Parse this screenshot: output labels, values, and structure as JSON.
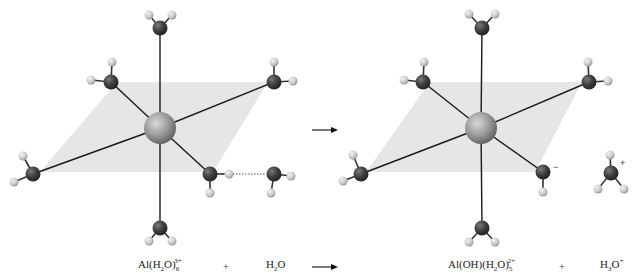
{
  "colors": {
    "background": "#ffffff",
    "plane": "#e6e6e6",
    "bond": "#1a1a1a",
    "oxygen": "#3d3d3d",
    "hydrogen": "#cfcfcf",
    "aluminum": "#9a9a9a"
  },
  "equation": {
    "reactant1": {
      "base": "Al(H",
      "sub1": "2",
      "mid": "O)",
      "sub2": "6",
      "sup": "3+"
    },
    "plus1": "+",
    "reactant2": {
      "base": "H",
      "sub1": "2",
      "tail": "O"
    },
    "product1": {
      "base": "Al(OH)(H",
      "sub1": "2",
      "mid": "O)",
      "sub2": "5",
      "sup": "2+"
    },
    "plus2": "+",
    "product2": {
      "base": "H",
      "sub1": "3",
      "tail": "O",
      "sup": "+"
    }
  },
  "annotations": {
    "hydroxide_charge": "−",
    "hydronium_charge": "+"
  }
}
